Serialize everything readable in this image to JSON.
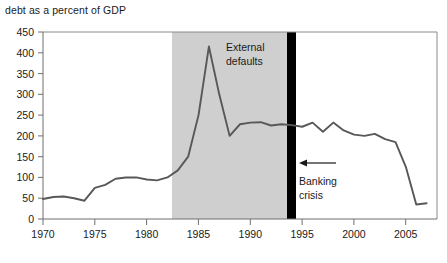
{
  "chart_data": {
    "type": "line",
    "title": "debt as a percent of GDP",
    "xlabel": "",
    "ylabel": "",
    "xlim": [
      1970,
      2008
    ],
    "ylim": [
      0,
      450
    ],
    "yticks": [
      0,
      50,
      100,
      150,
      200,
      250,
      300,
      350,
      400,
      450
    ],
    "xticks": [
      1970,
      1975,
      1980,
      1985,
      1990,
      1995,
      2000,
      2005
    ],
    "grid": false,
    "legend": null,
    "series": [
      {
        "name": "debt as a percent of GDP",
        "color": "#58585a",
        "x": [
          1970,
          1971,
          1972,
          1973,
          1974,
          1975,
          1976,
          1977,
          1978,
          1979,
          1980,
          1981,
          1982,
          1983,
          1984,
          1985,
          1986,
          1987,
          1988,
          1989,
          1990,
          1991,
          1992,
          1993,
          1994,
          1995,
          1996,
          1997,
          1998,
          1999,
          2000,
          2001,
          2002,
          2003,
          2004,
          2005,
          2006,
          2007
        ],
        "values": [
          48,
          53,
          54,
          50,
          44,
          75,
          82,
          97,
          100,
          100,
          95,
          93,
          100,
          117,
          150,
          250,
          415,
          300,
          200,
          228,
          232,
          233,
          225,
          228,
          226,
          222,
          232,
          210,
          232,
          213,
          203,
          200,
          205,
          192,
          185,
          125,
          35,
          38
        ]
      }
    ],
    "annotations": [
      {
        "name": "external-defaults-band",
        "type": "vband",
        "label": "External\ndefaults",
        "label_line1": "External",
        "label_line2": "defaults",
        "x_start": 1984,
        "x_end": 1995,
        "color": "#cfcfcf"
      },
      {
        "name": "banking-crisis-marker",
        "type": "vline",
        "label_line1": "Banking",
        "label_line2": "crisis",
        "x": 1996,
        "color": "#000000"
      }
    ]
  },
  "axis": {
    "y_tick_labels": [
      "450",
      "400",
      "350",
      "300",
      "250",
      "200",
      "150",
      "100",
      "50",
      "0"
    ],
    "x_tick_labels": [
      "1970",
      "1975",
      "1980",
      "1985",
      "1990",
      "1995",
      "2000",
      "2005"
    ]
  },
  "labels": {
    "external_defaults_line1": "External",
    "external_defaults_line2": "defaults",
    "banking_crisis_line1": "Banking",
    "banking_crisis_line2": "crisis"
  },
  "colors": {
    "band": "#cfcfcf",
    "marker": "#000000",
    "line": "#58585a",
    "axis": "#6f6f6f",
    "text": "#1a1a1a",
    "background": "#ffffff"
  }
}
